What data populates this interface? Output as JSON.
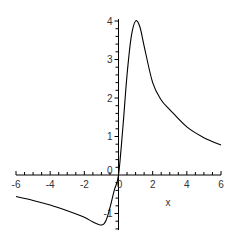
{
  "chart_data": {
    "type": "line",
    "title": "",
    "xlabel": "x",
    "ylabel": "",
    "xlim": [
      -6,
      6
    ],
    "ylim": [
      -1.43,
      4.05
    ],
    "grid": false,
    "legend": "none",
    "x_ticks": [
      -6,
      -4,
      -2,
      0,
      2,
      4,
      6
    ],
    "x_tick_labels": [
      "-6",
      "-4",
      "-2",
      "0",
      "2",
      "4",
      "6"
    ],
    "y_ticks": [
      -1,
      1,
      2,
      3,
      4
    ],
    "y_tick_labels": [
      "-1",
      "1",
      "2",
      "3",
      "4"
    ],
    "origin_label": "0",
    "line_color": "#000000",
    "axis_color": "#000000",
    "series": [
      {
        "name": "f(x)",
        "x": [
          -6,
          -5,
          -4,
          -3,
          -2,
          -1.5,
          -1,
          -0.75,
          -0.5,
          -0.25,
          0,
          0.25,
          0.5,
          0.75,
          1,
          1.25,
          1.5,
          2,
          2.5,
          3,
          4,
          5,
          6
        ],
        "y": [
          -0.56,
          -0.66,
          -0.78,
          -0.93,
          -1.1,
          -1.22,
          -1.3,
          -1.2,
          -0.85,
          -0.4,
          0,
          1.2,
          2.6,
          3.6,
          4.0,
          3.85,
          3.35,
          2.4,
          1.95,
          1.7,
          1.25,
          0.97,
          0.78
        ]
      }
    ]
  }
}
